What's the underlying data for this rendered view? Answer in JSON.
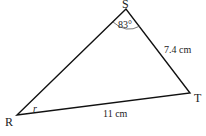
{
  "diagram": {
    "type": "triangle",
    "vertices": {
      "S": {
        "label": "S",
        "x": 126,
        "y": 9
      },
      "R": {
        "label": "R",
        "x": 17,
        "y": 115
      },
      "T": {
        "label": "T",
        "x": 190,
        "y": 93
      }
    },
    "angle_S": "83°",
    "angle_R": "r",
    "side_ST": "7.4 cm",
    "side_RT": "11 cm",
    "stroke_color": "#111111"
  }
}
